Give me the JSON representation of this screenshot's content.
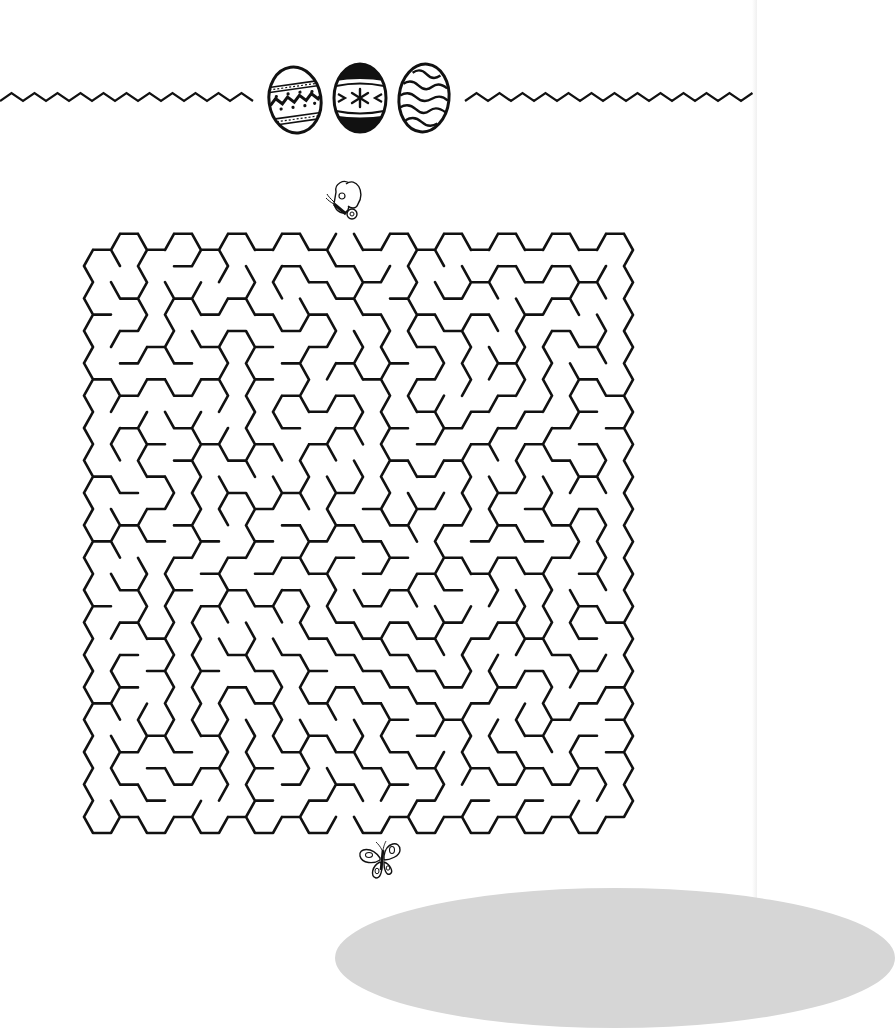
{
  "worksheet": {
    "title": "Easter Egg Maze",
    "start_marker": "butterfly-top",
    "end_marker": "butterfly-bottom"
  },
  "header": {
    "eggs": [
      {
        "name": "egg-dotted-zigzag",
        "pattern": "zigzag-with-dots-and-bands"
      },
      {
        "name": "egg-black-flower",
        "pattern": "black-caps-with-flower"
      },
      {
        "name": "egg-wavy-stripes",
        "pattern": "wavy-lines"
      }
    ],
    "divider_style": "zigzag"
  },
  "maze": {
    "type": "hexagonal",
    "columns": 20,
    "rows": 18,
    "hex_side_px": 18,
    "origin_x": 102,
    "origin_y_even": 266,
    "origin_y_odd": 250,
    "col_step": 27,
    "row_step": 32.4,
    "entrance": {
      "col": 9,
      "row": 0,
      "side": "top"
    },
    "exit": {
      "col": 9,
      "row": 17,
      "side": "bottom"
    },
    "stroke_color": "#111111",
    "stroke_width": 2.6
  },
  "colors": {
    "background": "#ffffff",
    "ink": "#111111",
    "footer_arc": "#d6d6d6"
  }
}
